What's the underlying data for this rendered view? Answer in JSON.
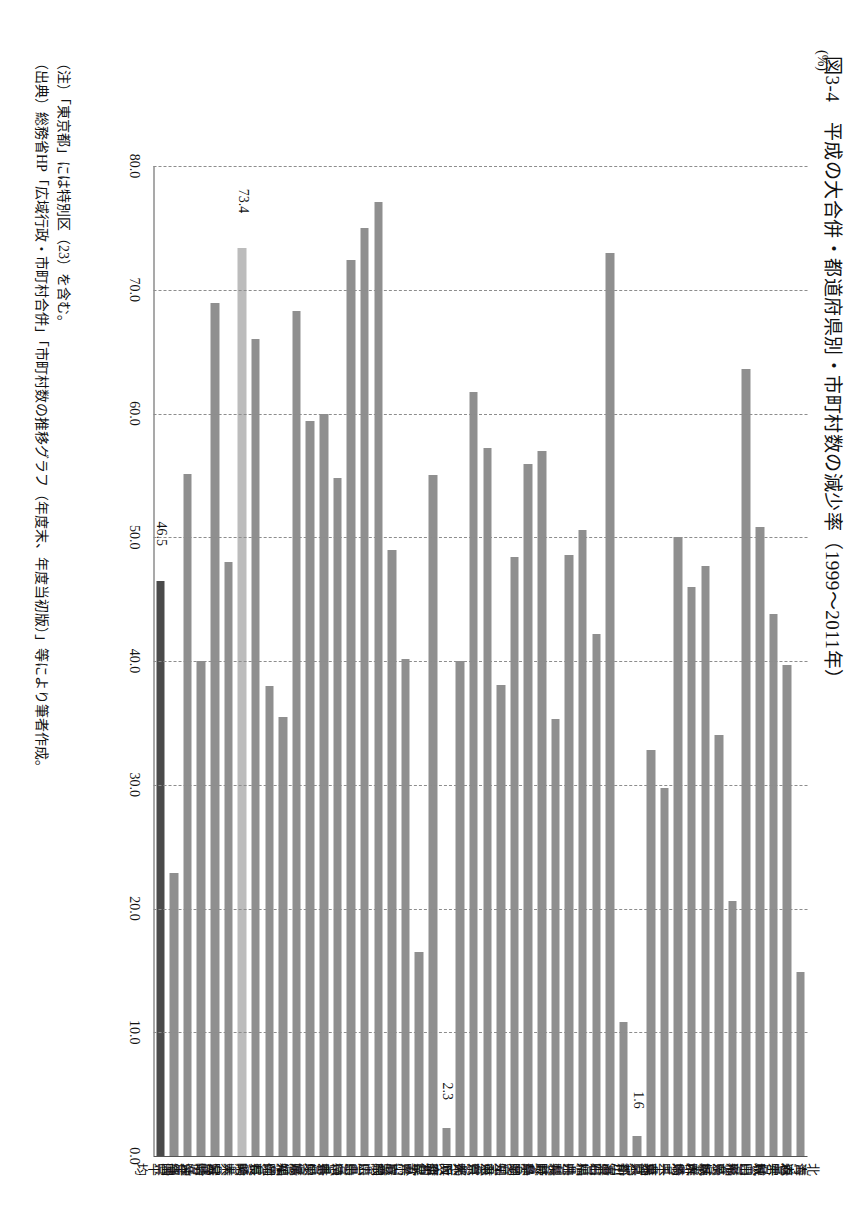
{
  "figure": {
    "title": "図3-4　平成の大合併・都道府県別・市町村数の減少率（1999〜2011年）",
    "unit_label": "(%)"
  },
  "notes": {
    "note": "（注）「東京都」には特別区（23）を含む。",
    "source": "（出典）総務省HP「広域行政・市町村合併」「市町村数の推移グラフ（年度末、年度当初版）」等により筆者作成。"
  },
  "colors": {
    "bar": "#8f8f8f",
    "average_bar": "#4a4a4a",
    "highlight_bar": "#bcbcbc",
    "grid": "#8d8d8d",
    "axis": "#555555"
  },
  "chart_data": {
    "type": "bar",
    "orientation": "horizontal",
    "title": "図3-4　平成の大合併・都道府県別・市町村数の減少率（1999〜2011年）",
    "xlabel": "(%)",
    "ylabel": "",
    "xlim": [
      0.0,
      80.0
    ],
    "xticks": [
      "80.0",
      "70.0",
      "60.0",
      "50.0",
      "40.0",
      "30.0",
      "20.0",
      "10.0",
      "0.0"
    ],
    "xtick_values": [
      80.0,
      70.0,
      60.0,
      50.0,
      40.0,
      30.0,
      20.0,
      10.0,
      0.0
    ],
    "grid": true,
    "legend": "none",
    "axis_direction": "values decrease left to right (80.0 at left, 0.0 at right)",
    "categories": [
      "北海道",
      "青森県",
      "岩手県",
      "宮城県",
      "秋田県",
      "山形県",
      "福島県",
      "茨城県",
      "栃木県",
      "群馬県",
      "埼玉県",
      "千葉県",
      "東京都",
      "神奈川県",
      "新潟県",
      "富山県",
      "石川県",
      "福井県",
      "山梨県",
      "長野県",
      "岐阜県",
      "静岡県",
      "愛知県",
      "三重県",
      "滋賀県",
      "京都府",
      "大阪府",
      "兵庫県",
      "奈良県",
      "和歌山県",
      "鳥取県",
      "島根県",
      "岡山県",
      "広島県",
      "山口県",
      "徳島県",
      "香川県",
      "愛媛県",
      "高知県",
      "福岡県",
      "佐賀県",
      "長崎県",
      "熊本県",
      "大分県",
      "宮崎県",
      "鹿児島県",
      "沖縄県",
      "全国平均"
    ],
    "values": [
      14.9,
      39.7,
      43.8,
      50.8,
      63.6,
      20.6,
      34.0,
      47.7,
      46.0,
      50.0,
      29.7,
      32.8,
      1.6,
      10.8,
      73.0,
      42.2,
      50.6,
      48.6,
      35.3,
      57.0,
      55.9,
      48.4,
      38.1,
      57.2,
      61.7,
      40.0,
      2.3,
      55.0,
      16.5,
      40.2,
      49.0,
      77.1,
      75.0,
      72.4,
      54.8,
      60.0,
      59.4,
      68.3,
      35.5,
      38.0,
      66.0,
      73.4,
      48.0,
      68.9,
      40.0,
      55.1,
      22.9,
      46.5
    ],
    "value_labels": [
      {
        "category": "全国平均",
        "value": 46.5,
        "text": "46.5"
      },
      {
        "category": "長崎県",
        "value": 73.4,
        "text": "73.4"
      },
      {
        "category": "大阪府",
        "value": 2.3,
        "text": "2.3"
      },
      {
        "category": "東京都",
        "value": 1.6,
        "text": "1.6"
      }
    ],
    "highlighted": {
      "全国平均": "dark",
      "長崎県": "light"
    }
  }
}
